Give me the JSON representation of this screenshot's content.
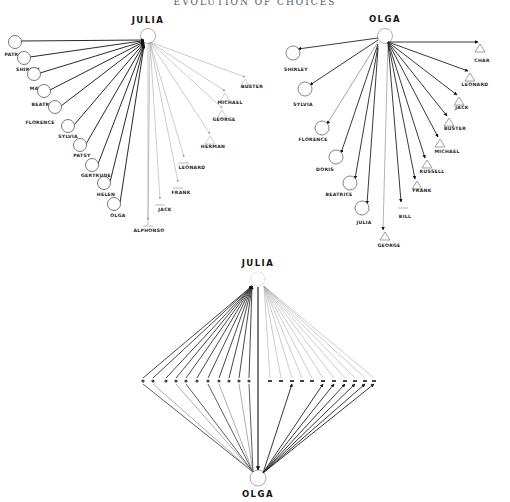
{
  "header": {
    "title": "EVOLUTION OF CHOICES"
  },
  "diagram_julia": {
    "center": "JULIA",
    "girls": [
      "PATRICE",
      "SHIRLEY",
      "MARIA",
      "BEATRICE",
      "FLORENCE",
      "SYLVIA",
      "PATSY",
      "GERTRUDE",
      "HELEN",
      "OLGA"
    ],
    "boys": [
      "ALPHONSO",
      "JACK",
      "FRANK",
      "LEONARD",
      "HERMAN",
      "GEORGE",
      "MICHAEL",
      "BUSTER"
    ]
  },
  "diagram_olga": {
    "center": "OLGA",
    "girls": [
      "SHIRLEY",
      "SYLVIA",
      "FLORENCE",
      "DORIS",
      "BEATRICE",
      "JULIA"
    ],
    "boys": [
      "GEORGE",
      "BILL",
      "FRANK",
      "RUSSELL",
      "MICHAEL",
      "BUSTER",
      "JACK",
      "LEONARD",
      "CHAR"
    ]
  },
  "diagram_combined": {
    "top": "JULIA",
    "bottom": "OLGA"
  },
  "annotations": {
    "rank_1": "1",
    "rank_2": "2",
    "rank_3": "3",
    "rank_4": "4"
  }
}
